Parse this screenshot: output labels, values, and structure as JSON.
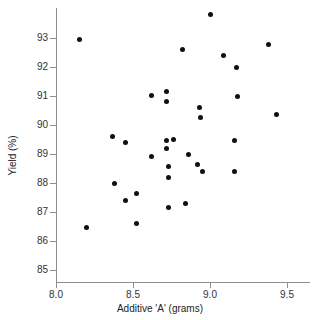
{
  "chart_data": {
    "type": "scatter",
    "title": "",
    "xlabel": "Additive 'A' (grams)",
    "ylabel": "Yield (%)",
    "xlim": [
      7.92,
      9.62
    ],
    "ylim": [
      84.6,
      94.1
    ],
    "xticks": [
      "8.0",
      "8.5",
      "9.0",
      "9.5"
    ],
    "xtick_values": [
      8.0,
      8.5,
      9.0,
      9.5
    ],
    "yticks": [
      "85",
      "86",
      "87",
      "88",
      "89",
      "90",
      "91",
      "92",
      "93"
    ],
    "ytick_values": [
      85,
      86,
      87,
      88,
      89,
      90,
      91,
      92,
      93
    ],
    "grid": false,
    "legend": false,
    "marker": "filled-circle",
    "marker_color": "#101010",
    "background_color": "#ffffff",
    "axis_color": "#8e8e8e",
    "points": [
      {
        "x": 8.15,
        "y": 92.95
      },
      {
        "x": 8.2,
        "y": 86.45
      },
      {
        "x": 8.37,
        "y": 89.6
      },
      {
        "x": 8.38,
        "y": 87.98
      },
      {
        "x": 8.45,
        "y": 89.38
      },
      {
        "x": 8.45,
        "y": 87.38
      },
      {
        "x": 8.52,
        "y": 87.65
      },
      {
        "x": 8.52,
        "y": 86.6
      },
      {
        "x": 8.62,
        "y": 91.02
      },
      {
        "x": 8.62,
        "y": 88.9
      },
      {
        "x": 8.72,
        "y": 91.15
      },
      {
        "x": 8.72,
        "y": 90.82
      },
      {
        "x": 8.72,
        "y": 89.48
      },
      {
        "x": 8.72,
        "y": 89.18
      },
      {
        "x": 8.73,
        "y": 88.58
      },
      {
        "x": 8.73,
        "y": 88.2
      },
      {
        "x": 8.73,
        "y": 87.15
      },
      {
        "x": 8.76,
        "y": 89.5
      },
      {
        "x": 8.82,
        "y": 92.62
      },
      {
        "x": 8.84,
        "y": 87.28
      },
      {
        "x": 8.86,
        "y": 89.0
      },
      {
        "x": 8.92,
        "y": 88.65
      },
      {
        "x": 8.93,
        "y": 90.6
      },
      {
        "x": 8.94,
        "y": 90.25
      },
      {
        "x": 8.95,
        "y": 88.38
      },
      {
        "x": 9.0,
        "y": 93.8
      },
      {
        "x": 9.09,
        "y": 92.38
      },
      {
        "x": 9.16,
        "y": 89.45
      },
      {
        "x": 9.16,
        "y": 88.4
      },
      {
        "x": 9.17,
        "y": 91.98
      },
      {
        "x": 9.18,
        "y": 90.98
      },
      {
        "x": 9.38,
        "y": 92.76
      },
      {
        "x": 9.43,
        "y": 90.35
      }
    ]
  }
}
